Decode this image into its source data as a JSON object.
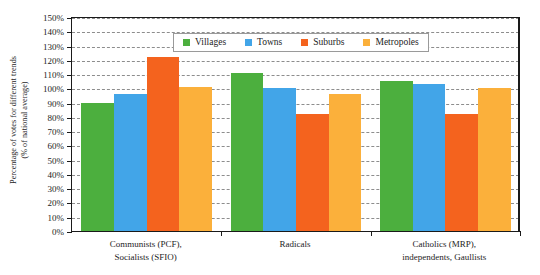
{
  "chart_data": {
    "type": "bar",
    "title": "",
    "xlabel": "",
    "ylabel": "Percentage of votes for different trends (% of national average)",
    "ylabel_lines": [
      "Percentage of votes for different trends",
      "(% of national average)"
    ],
    "ylim": [
      0,
      150
    ],
    "ytick_step": 10,
    "ytick_labels": [
      "0%",
      "10%",
      "20%",
      "30%",
      "40%",
      "50%",
      "60%",
      "70%",
      "80%",
      "90%",
      "100%",
      "110%",
      "120%",
      "130%",
      "140%",
      "150%"
    ],
    "ytick_values": [
      0,
      10,
      20,
      30,
      40,
      50,
      60,
      70,
      80,
      90,
      100,
      110,
      120,
      130,
      140,
      150
    ],
    "grid": true,
    "grid_axis": "y",
    "legend_position": "top-center",
    "categories": [
      "Communists (PCF), Socialists (SFIO)",
      "Radicals",
      "Catholics (MRP), independents, Gaullists"
    ],
    "category_lines": [
      [
        "Communists (PCF),",
        "Socialists (SFIO)"
      ],
      [
        "Radicals"
      ],
      [
        "Catholics (MRP),",
        "independents, Gaullists"
      ]
    ],
    "series": [
      {
        "name": "Villages",
        "color": "#4CAF3E",
        "values": [
          90,
          111,
          105
        ]
      },
      {
        "name": "Towns",
        "color": "#42A5E8",
        "values": [
          96,
          100,
          103
        ]
      },
      {
        "name": "Suburbs",
        "color": "#F4631E",
        "values": [
          122,
          82,
          82
        ]
      },
      {
        "name": "Metropoles",
        "color": "#FBB03B",
        "values": [
          101,
          96,
          100
        ]
      }
    ]
  },
  "legend": {
    "items": [
      {
        "label": "Villages",
        "color": "#4CAF3E"
      },
      {
        "label": "Towns",
        "color": "#42A5E8"
      },
      {
        "label": "Suburbs",
        "color": "#F4631E"
      },
      {
        "label": "Metropoles",
        "color": "#FBB03B"
      }
    ]
  },
  "colors": {
    "villages": "#4CAF3E",
    "towns": "#42A5E8",
    "suburbs": "#F4631E",
    "metropoles": "#FBB03B",
    "axis": "#1a1a1a",
    "grid": "#8d8d8d",
    "background": "#ffffff"
  }
}
